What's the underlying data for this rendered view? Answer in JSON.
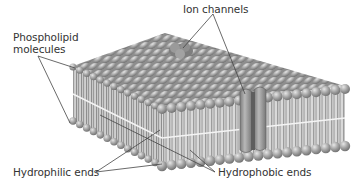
{
  "diagram": {
    "labels": {
      "phospholipid_line1": "Phospholipid",
      "phospholipid_line2": "molecules",
      "ion_channels": "Ion channels",
      "hydrophilic": "Hydrophilic ends",
      "hydrophobic": "Hydrophobic ends"
    },
    "colors": {
      "head": "#9a9a9a",
      "head_light": "#d8d8d8",
      "tail": "#b4b4b4",
      "channel": "#8c8c8c",
      "leader_line": "#444444",
      "text": "#333333"
    }
  }
}
